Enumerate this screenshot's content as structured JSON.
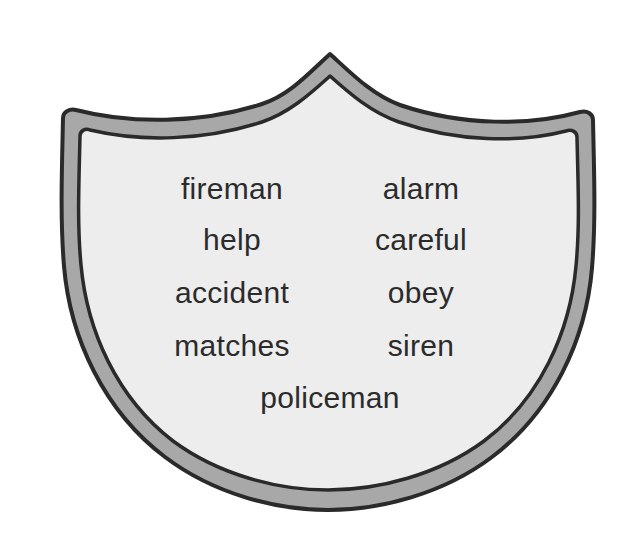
{
  "figure": {
    "kind": "shield-badge-word-list",
    "background_color": "#ffffff",
    "shield": {
      "outline_color": "#2a2a2a",
      "border_band_color": "#a8a8a8",
      "interior_color": "#ededed",
      "outer_stroke_width": 4,
      "inner_stroke_width": 3.5
    },
    "text_color": "#2b2b2b"
  },
  "word_list": {
    "rows": [
      {
        "left": "fireman",
        "right": "alarm"
      },
      {
        "left": "help",
        "right": "careful"
      },
      {
        "left": "accident",
        "right": "obey"
      },
      {
        "left": "matches",
        "right": "siren"
      }
    ],
    "bottom_word": "policeman",
    "all_words": [
      "fireman",
      "alarm",
      "help",
      "careful",
      "accident",
      "obey",
      "matches",
      "siren",
      "policeman"
    ]
  }
}
